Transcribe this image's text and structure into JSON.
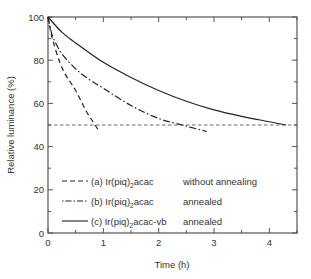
{
  "chart_data": {
    "type": "line",
    "title": "",
    "xlabel": "Time (h)",
    "ylabel": "Relative luminance (%)",
    "xlim": [
      0,
      4.5
    ],
    "ylim": [
      0,
      100
    ],
    "xticks": [
      0,
      1,
      2,
      3,
      4
    ],
    "yticks": [
      0,
      20,
      40,
      60,
      80,
      100
    ],
    "grid": false,
    "legend_position": "lower-left",
    "reference_line": {
      "y": 50,
      "style": "dashed",
      "x_range": [
        0,
        4.5
      ]
    },
    "series": [
      {
        "name": "(a) Ir(piq)2acac",
        "label_main": "(a) Ir(piq)",
        "label_sub": "2",
        "label_tail": "acac",
        "condition": "without annealing",
        "style": "dashed",
        "x": [
          0,
          0.05,
          0.1,
          0.2,
          0.3,
          0.4,
          0.5,
          0.6,
          0.7,
          0.8,
          0.9
        ],
        "y": [
          100,
          93,
          88,
          80,
          74,
          70,
          66,
          61,
          56,
          52,
          48
        ]
      },
      {
        "name": "(b) Ir(piq)2acac",
        "label_main": "(b) Ir(piq)",
        "label_sub": "2",
        "label_tail": "acac",
        "condition": "annealed",
        "style": "dashdot",
        "x": [
          0,
          0.05,
          0.1,
          0.25,
          0.5,
          0.75,
          1.0,
          1.5,
          2.0,
          2.5,
          2.87
        ],
        "y": [
          100,
          94,
          90,
          83,
          76,
          71,
          67,
          59,
          53,
          49.5,
          47
        ]
      },
      {
        "name": "(c) Ir(piq)2acac-vb",
        "label_main": "(c) Ir(piq)",
        "label_sub": "2",
        "label_tail": "acac-vb",
        "condition": "annealed",
        "style": "solid",
        "x": [
          0,
          0.25,
          0.5,
          1.0,
          1.5,
          2.0,
          2.5,
          3.0,
          3.5,
          4.0,
          4.3
        ],
        "y": [
          100,
          93,
          88,
          79,
          72,
          66,
          61,
          57,
          54,
          51.5,
          50
        ]
      }
    ]
  }
}
